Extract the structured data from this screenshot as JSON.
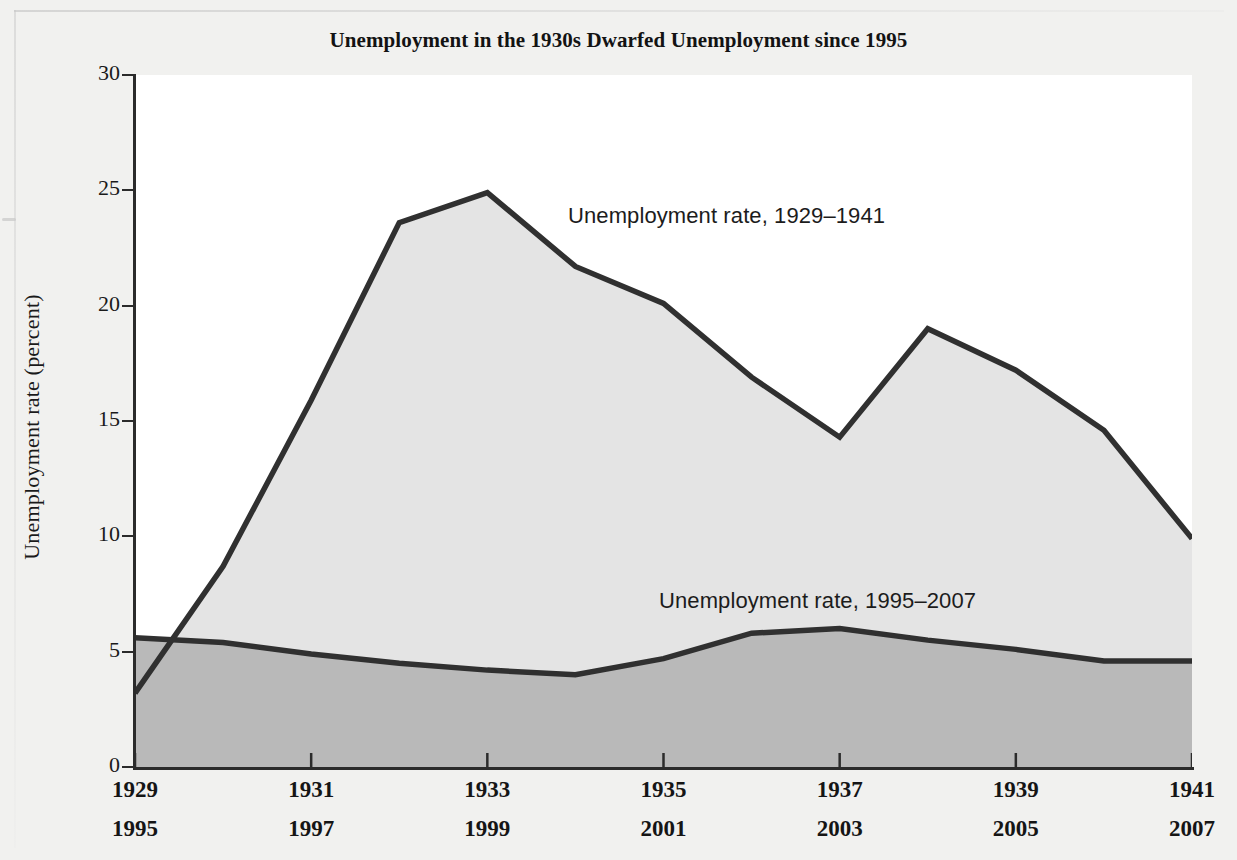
{
  "title": "Unemployment in the 1930s Dwarfed Unemployment since 1995",
  "axes": {
    "ylabel": "Unemployment rate (percent)",
    "yticks": [
      "0",
      "5",
      "10",
      "15",
      "20",
      "25",
      "30"
    ],
    "xticks_row1": [
      "1929",
      "1931",
      "1933",
      "1935",
      "1937",
      "1939",
      "1941"
    ],
    "xticks_row2": [
      "1995",
      "1997",
      "1999",
      "2001",
      "2003",
      "2005",
      "2007"
    ]
  },
  "annotations": {
    "upper": "Unemployment rate, 1929–1941",
    "lower": "Unemployment rate, 1995–2007"
  },
  "colors": {
    "line": "#303030",
    "upper_area_fill": "#e4e4e4",
    "lower_area_fill": "#b9b9b9",
    "plot_background": "#ffffff",
    "page_background": "#f1f1ef",
    "text": "#151515"
  },
  "chart_data": {
    "type": "area",
    "title": "Unemployment in the 1930s Dwarfed Unemployment since 1995",
    "xlabel": "",
    "ylabel": "Unemployment rate (percent)",
    "ylim": [
      0,
      30
    ],
    "xlim": [
      0,
      12
    ],
    "grid": false,
    "legend": "inline annotations",
    "x_primary": [
      1929,
      1930,
      1931,
      1932,
      1933,
      1934,
      1935,
      1936,
      1937,
      1938,
      1939,
      1940,
      1941
    ],
    "x_secondary": [
      1995,
      1996,
      1997,
      1998,
      1999,
      2000,
      2001,
      2002,
      2003,
      2004,
      2005,
      2006,
      2007
    ],
    "series": [
      {
        "name": "Unemployment rate, 1929–1941",
        "axis": "x_primary",
        "values": [
          3.2,
          8.7,
          15.9,
          23.6,
          24.9,
          21.7,
          20.1,
          16.9,
          14.3,
          19.0,
          17.2,
          14.6,
          9.9
        ]
      },
      {
        "name": "Unemployment rate, 1995–2007",
        "axis": "x_secondary",
        "values": [
          5.6,
          5.4,
          4.9,
          4.5,
          4.2,
          4.0,
          4.7,
          5.8,
          6.0,
          5.5,
          5.1,
          4.6,
          4.6
        ]
      }
    ]
  }
}
